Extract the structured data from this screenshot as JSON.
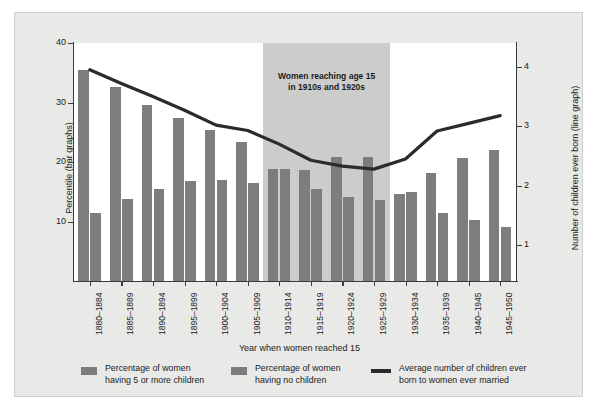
{
  "chart_data": {
    "type": "bar",
    "title": "",
    "subtitle": "",
    "xlabel": "Year when women reached 15",
    "ylabel": "Percentile (bar graphs)",
    "y2label": "Number of children ever born (line graph)",
    "ylim": [
      0,
      40
    ],
    "yticks": [
      10,
      20,
      30,
      40
    ],
    "y2lim": [
      0.4,
      4.4
    ],
    "y2ticks": [
      1,
      2,
      3,
      4
    ],
    "grid": false,
    "legend_position": "bottom",
    "categories": [
      "1880–1884",
      "1885–1889",
      "1890–1894",
      "1895–1899",
      "1900–1904",
      "1905–1909",
      "1910–1914",
      "1915–1919",
      "1920–1924",
      "1925–1929",
      "1930–1934",
      "1935–1939",
      "1940–1945",
      "1945–1950"
    ],
    "series": [
      {
        "name": "Percentage of women having 5 or more children",
        "type": "bar",
        "axis": "left",
        "color": "#7d7d7d",
        "values": [
          35.4,
          32.6,
          29.6,
          27.4,
          25.3,
          23.4,
          18.8,
          18.6,
          20.8,
          20.8,
          14.7,
          18.2,
          20.6,
          22.1
        ]
      },
      {
        "name": "Percentage of women having no children",
        "type": "bar",
        "axis": "left",
        "color": "#7d7d7d",
        "values": [
          11.4,
          13.8,
          15.5,
          16.8,
          16.9,
          16.5,
          18.8,
          15.5,
          14.2,
          13.6,
          15.0,
          11.4,
          10.2,
          9.0
        ]
      },
      {
        "name": "Average number of children ever born to women ever married",
        "type": "line",
        "axis": "right",
        "color": "#2b2b2b",
        "values": [
          3.95,
          3.72,
          3.5,
          3.27,
          3.02,
          2.93,
          2.7,
          2.43,
          2.33,
          2.28,
          2.45,
          2.92,
          3.05,
          3.18
        ]
      }
    ],
    "annotations": [
      {
        "name": "shaded-cohort-band",
        "text_line1": "Women reaching age 15",
        "text_line2": "in 1910s and 1920s",
        "span_categories": [
          "1910–1914",
          "1925–1929"
        ],
        "color": "#cccccb"
      }
    ]
  },
  "axes": {
    "left": {
      "title": "Percentile (bar graphs)",
      "ticks": [
        "10",
        "20",
        "30",
        "40"
      ]
    },
    "right": {
      "title": "Number of children ever born (line graph)",
      "ticks": [
        "1",
        "2",
        "3",
        "4"
      ]
    },
    "bottom": {
      "title": "Year when women reached 15",
      "ticks": [
        "1880–1884",
        "1885–1889",
        "1890–1894",
        "1895–1899",
        "1900–1904",
        "1905–1909",
        "1910–1914",
        "1915–1919",
        "1920–1924",
        "1925–1929",
        "1930–1934",
        "1935–1939",
        "1940–1945",
        "1945–1950"
      ]
    }
  },
  "annotation": {
    "line1": "Women reaching age 15",
    "line2": "in 1910s and 1920s"
  },
  "legend": {
    "items": [
      {
        "symbol": "swatch",
        "line1": "Percentage of women",
        "line2": "having 5 or more children"
      },
      {
        "symbol": "swatch",
        "line1": "Percentage of women",
        "line2": "having no children"
      },
      {
        "symbol": "line",
        "line1": "Average number of children ever",
        "line2": "born to women ever married"
      }
    ]
  },
  "colors": {
    "bar": "#7d7d7d",
    "line": "#2b2b2b",
    "band": "#cccccb",
    "figure_background": "#e9e9e7",
    "plot_background": "#ffffff",
    "axis": "#3a3a3a"
  }
}
